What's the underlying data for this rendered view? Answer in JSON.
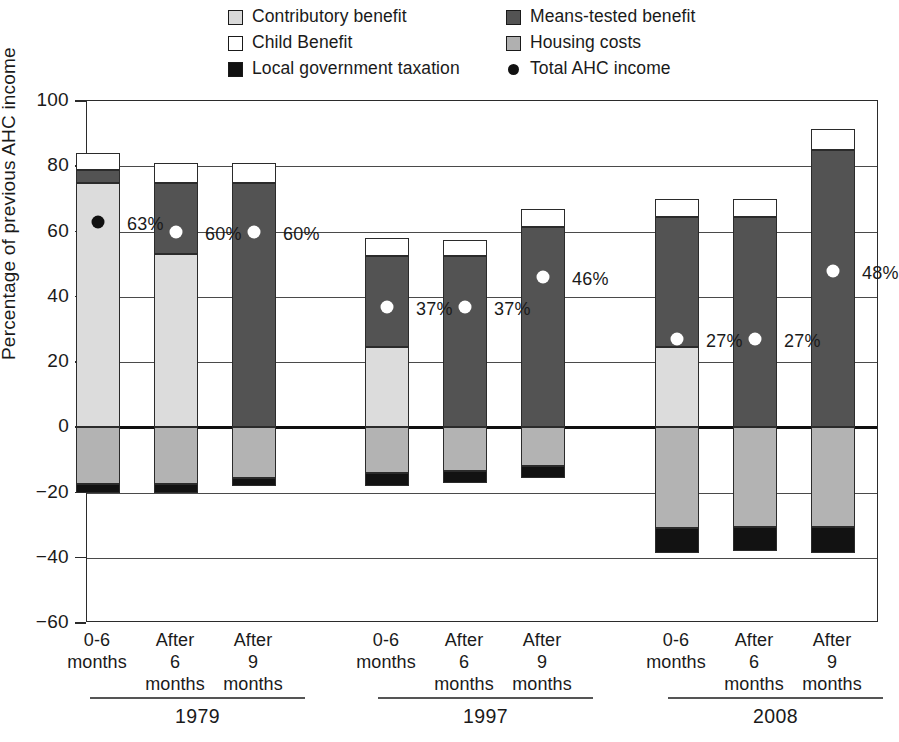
{
  "legend": {
    "items": [
      {
        "key": "contributory",
        "label": "Contributory benefit",
        "icon": "square-swatch-light-gray",
        "color": "#d9d9d9",
        "column": 1
      },
      {
        "key": "child",
        "label": "Child Benefit",
        "icon": "square-swatch-white",
        "color": "#ffffff",
        "column": 1
      },
      {
        "key": "localgov",
        "label": "Local government taxation",
        "icon": "square-swatch-black",
        "color": "#111111",
        "column": 1
      },
      {
        "key": "means",
        "label": "Means-tested benefit",
        "icon": "square-swatch-dark-gray",
        "color": "#535353",
        "column": 2
      },
      {
        "key": "housing",
        "label": "Housing costs",
        "icon": "square-swatch-mid-gray",
        "color": "#b0b0b0",
        "column": 2
      },
      {
        "key": "total",
        "label": "Total AHC income",
        "icon": "filled-circle-marker",
        "color": "#111111",
        "column": 2
      }
    ]
  },
  "axis": {
    "y_title": "Percentage of previous AHC income",
    "y_ticks": [
      "100",
      "80",
      "60",
      "40",
      "20",
      "0",
      "−20",
      "−40",
      "−60"
    ],
    "y_min": -60,
    "y_max": 100,
    "y_step": 20
  },
  "groups": [
    {
      "name": "1979",
      "categories": [
        "0-6\nmonths",
        "After\n6\nmonths",
        "After\n9\nmonths"
      ]
    },
    {
      "name": "1997",
      "categories": [
        "0-6\nmonths",
        "After\n6\nmonths",
        "After\n9\nmonths"
      ]
    },
    {
      "name": "2008",
      "categories": [
        "0-6\nmonths",
        "After\n6\nmonths",
        "After\n9\nmonths"
      ]
    }
  ],
  "chart_data": {
    "type": "bar",
    "title": "",
    "subtitle": "",
    "xlabel": "",
    "ylabel": "Percentage of previous AHC income",
    "ylim": [
      -60,
      100
    ],
    "ytick_values": [
      100,
      80,
      60,
      40,
      20,
      0,
      -20,
      -40,
      -60
    ],
    "grid": true,
    "stacked": true,
    "legend_position": "top",
    "categories": [
      "1979 0-6 months",
      "1979 After 6 months",
      "1979 After 9 months",
      "1997 0-6 months",
      "1997 After 6 months",
      "1997 After 9 months",
      "2008 0-6 months",
      "2008 After 6 months",
      "2008 After 9 months"
    ],
    "group_labels": [
      "1979",
      "1997",
      "2008"
    ],
    "series": [
      {
        "name": "Contributory benefit",
        "color": "#d9d9d9",
        "values": [
          75.0,
          53.0,
          0.0,
          24.5,
          0.0,
          0.0,
          24.5,
          0.0,
          0.0
        ]
      },
      {
        "name": "Means-tested benefit",
        "color": "#535353",
        "values": [
          4.0,
          22.0,
          75.0,
          28.0,
          52.5,
          61.5,
          40.0,
          40.0,
          85.0
        ]
      },
      {
        "name": "Child Benefit",
        "color": "#ffffff",
        "values": [
          5.0,
          6.0,
          6.0,
          5.5,
          5.0,
          5.5,
          5.5,
          5.5,
          6.5
        ]
      },
      {
        "name": "Housing costs",
        "color": "#b0b0b0",
        "values": [
          -17.5,
          -17.5,
          -15.5,
          -14.0,
          -13.5,
          -12.0,
          -31.0,
          -30.5,
          -30.5
        ]
      },
      {
        "name": "Local government taxation",
        "color": "#111111",
        "values": [
          -2.5,
          -2.5,
          -2.5,
          -4.0,
          -3.5,
          -3.5,
          -7.5,
          -7.5,
          -8.0
        ]
      }
    ],
    "totals_stacked_top": [
      84.0,
      81.0,
      81.0,
      58.0,
      57.5,
      67.0,
      70.0,
      70.0,
      91.5
    ],
    "marker_series": {
      "name": "Total AHC income",
      "marker": "circle",
      "values": [
        63,
        60,
        60,
        37,
        37,
        46,
        27,
        27,
        48
      ],
      "labels": [
        "63%",
        "60%",
        "60%",
        "37%",
        "37%",
        "46%",
        "27%",
        "27%",
        "48%"
      ]
    }
  },
  "bars": [
    {
      "id": "g1b1",
      "x": 97,
      "marker": 63,
      "marker_label": "63%",
      "marker_on": "light",
      "segments": [
        {
          "cls": "child",
          "from": 79.0,
          "to": 84.0
        },
        {
          "cls": "means",
          "from": 75.0,
          "to": 79.0
        },
        {
          "cls": "contributory",
          "from": 0.0,
          "to": 75.0
        },
        {
          "cls": "housing",
          "from": -17.5,
          "to": 0.0
        },
        {
          "cls": "localgov",
          "from": -20.0,
          "to": -17.5
        }
      ]
    },
    {
      "id": "g1b2",
      "x": 175,
      "marker": 60,
      "marker_label": "60%",
      "marker_on": "dark",
      "segments": [
        {
          "cls": "child",
          "from": 75.0,
          "to": 81.0
        },
        {
          "cls": "means",
          "from": 53.0,
          "to": 75.0
        },
        {
          "cls": "contributory",
          "from": 0.0,
          "to": 53.0
        },
        {
          "cls": "housing",
          "from": -17.5,
          "to": 0.0
        },
        {
          "cls": "localgov",
          "from": -20.0,
          "to": -17.5
        }
      ]
    },
    {
      "id": "g1b3",
      "x": 253,
      "marker": 60,
      "marker_label": "60%",
      "marker_on": "dark",
      "segments": [
        {
          "cls": "child",
          "from": 75.0,
          "to": 81.0
        },
        {
          "cls": "means",
          "from": 0.0,
          "to": 75.0
        },
        {
          "cls": "housing",
          "from": -15.5,
          "to": 0.0
        },
        {
          "cls": "localgov",
          "from": -18.0,
          "to": -15.5
        }
      ]
    },
    {
      "id": "g2b1",
      "x": 386,
      "marker": 37,
      "marker_label": "37%",
      "marker_on": "dark",
      "segments": [
        {
          "cls": "child",
          "from": 52.5,
          "to": 58.0
        },
        {
          "cls": "means",
          "from": 24.5,
          "to": 52.5
        },
        {
          "cls": "contributory",
          "from": 0.0,
          "to": 24.5
        },
        {
          "cls": "housing",
          "from": -14.0,
          "to": 0.0
        },
        {
          "cls": "localgov",
          "from": -18.0,
          "to": -14.0
        }
      ]
    },
    {
      "id": "g2b2",
      "x": 464,
      "marker": 37,
      "marker_label": "37%",
      "marker_on": "dark",
      "segments": [
        {
          "cls": "child",
          "from": 52.5,
          "to": 57.5
        },
        {
          "cls": "means",
          "from": 0.0,
          "to": 52.5
        },
        {
          "cls": "housing",
          "from": -13.5,
          "to": 0.0
        },
        {
          "cls": "localgov",
          "from": -17.0,
          "to": -13.5
        }
      ]
    },
    {
      "id": "g2b3",
      "x": 542,
      "marker": 46,
      "marker_label": "46%",
      "marker_on": "dark",
      "segments": [
        {
          "cls": "child",
          "from": 61.5,
          "to": 67.0
        },
        {
          "cls": "means",
          "from": 0.0,
          "to": 61.5
        },
        {
          "cls": "housing",
          "from": -12.0,
          "to": 0.0
        },
        {
          "cls": "localgov",
          "from": -15.5,
          "to": -12.0
        }
      ]
    },
    {
      "id": "g3b1",
      "x": 676,
      "marker": 27,
      "marker_label": "27%",
      "marker_on": "dark",
      "segments": [
        {
          "cls": "child",
          "from": 64.5,
          "to": 70.0
        },
        {
          "cls": "means",
          "from": 24.5,
          "to": 64.5
        },
        {
          "cls": "contributory",
          "from": 0.0,
          "to": 24.5
        },
        {
          "cls": "housing",
          "from": -31.0,
          "to": 0.0
        },
        {
          "cls": "localgov",
          "from": -38.5,
          "to": -31.0
        }
      ]
    },
    {
      "id": "g3b2",
      "x": 754,
      "marker": 27,
      "marker_label": "27%",
      "marker_on": "dark",
      "segments": [
        {
          "cls": "child",
          "from": 64.5,
          "to": 70.0
        },
        {
          "cls": "means",
          "from": 0.0,
          "to": 64.5
        },
        {
          "cls": "housing",
          "from": -30.5,
          "to": 0.0
        },
        {
          "cls": "localgov",
          "from": -38.0,
          "to": -30.5
        }
      ]
    },
    {
      "id": "g3b3",
      "x": 832,
      "marker": 48,
      "marker_label": "48%",
      "marker_on": "dark",
      "segments": [
        {
          "cls": "child",
          "from": 85.0,
          "to": 91.5
        },
        {
          "cls": "means",
          "from": 0.0,
          "to": 85.0
        },
        {
          "cls": "housing",
          "from": -30.5,
          "to": 0.0
        },
        {
          "cls": "localgov",
          "from": -38.5,
          "to": -30.5
        }
      ]
    }
  ],
  "category_labels": [
    {
      "x": 97,
      "lines": [
        "0-6",
        "months"
      ]
    },
    {
      "x": 175,
      "lines": [
        "After",
        "6",
        "months"
      ]
    },
    {
      "x": 253,
      "lines": [
        "After",
        "9",
        "months"
      ]
    },
    {
      "x": 386,
      "lines": [
        "0-6",
        "months"
      ]
    },
    {
      "x": 464,
      "lines": [
        "After",
        "6",
        "months"
      ]
    },
    {
      "x": 542,
      "lines": [
        "After",
        "9",
        "months"
      ]
    },
    {
      "x": 676,
      "lines": [
        "0-6",
        "months"
      ]
    },
    {
      "x": 754,
      "lines": [
        "After",
        "6",
        "months"
      ]
    },
    {
      "x": 832,
      "lines": [
        "After",
        "9",
        "months"
      ]
    }
  ],
  "group_footers": [
    {
      "label": "1979",
      "left": 90,
      "width": 215
    },
    {
      "label": "1997",
      "left": 378,
      "width": 215
    },
    {
      "label": "2008",
      "left": 668,
      "width": 215
    }
  ]
}
